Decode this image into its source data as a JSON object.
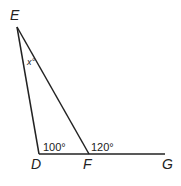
{
  "diagram": {
    "points": {
      "E": {
        "label": "E"
      },
      "D": {
        "label": "D"
      },
      "F": {
        "label": "F"
      },
      "G": {
        "label": "G"
      }
    },
    "angles": {
      "EDF": "100°",
      "EFG": "120°",
      "DEF": "x°"
    },
    "colors": {
      "line": "#222222",
      "background": "#ffffff"
    }
  }
}
